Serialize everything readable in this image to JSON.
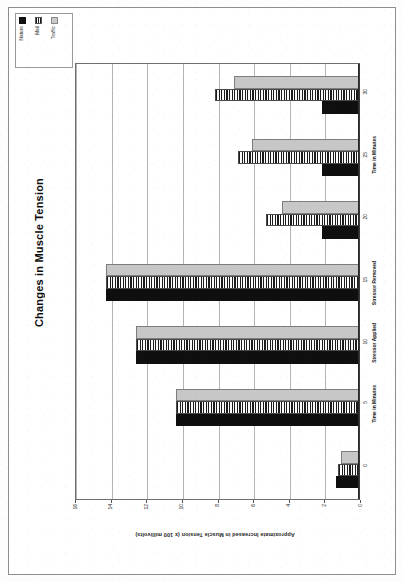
{
  "chart_data": {
    "type": "bar",
    "orientation": "rotated-90ccw",
    "title": "Changes in Muscle Tension",
    "xlabel": "",
    "ylabel": "Approximate Increased in Muscle Tension (x 100 millivolts)",
    "categories": [
      "0",
      "5",
      "10",
      "15",
      "20",
      "25",
      "30"
    ],
    "category_annotations": [
      {
        "label": "Time in Minutes",
        "at": "5"
      },
      {
        "label": "Stressor Applied",
        "at": "10"
      },
      {
        "label": "Stressor Removed",
        "at": "15"
      },
      {
        "label": "Time in Minutes",
        "at": "25"
      }
    ],
    "series": [
      {
        "name": "Nature",
        "color": "#0f0f0f",
        "pattern": "solid-black",
        "values": [
          1.3,
          10.3,
          12.5,
          14.2,
          2.1,
          2.1,
          2.1
        ]
      },
      {
        "name": "Mail",
        "color": "#1b1b1b",
        "pattern": "vertical-stripes",
        "values": [
          1.2,
          10.3,
          12.5,
          14.2,
          5.2,
          6.8,
          8.1
        ]
      },
      {
        "name": "Traffic",
        "color": "#c7c7c7",
        "pattern": "light-gray-fill",
        "values": [
          1.0,
          10.3,
          12.5,
          14.2,
          4.3,
          6.0,
          7.0
        ]
      }
    ],
    "ylim": [
      0,
      16
    ],
    "ytick_values": [
      16,
      14,
      12,
      10,
      8,
      6,
      4,
      2,
      0
    ],
    "ytick_labels": [
      "16",
      "14",
      "12",
      "10",
      "8",
      "6",
      "4",
      "2",
      "0"
    ],
    "grid": true,
    "grid_axis": "value",
    "legend": {
      "position": "top-left",
      "entries": [
        {
          "label": "Nature",
          "swatch": "solid-black"
        },
        {
          "label": "Mail",
          "swatch": "vertical-stripes"
        },
        {
          "label": "Traffic",
          "swatch": "light-gray-fill"
        }
      ]
    }
  },
  "page": {
    "media": "scanned-document-page"
  }
}
